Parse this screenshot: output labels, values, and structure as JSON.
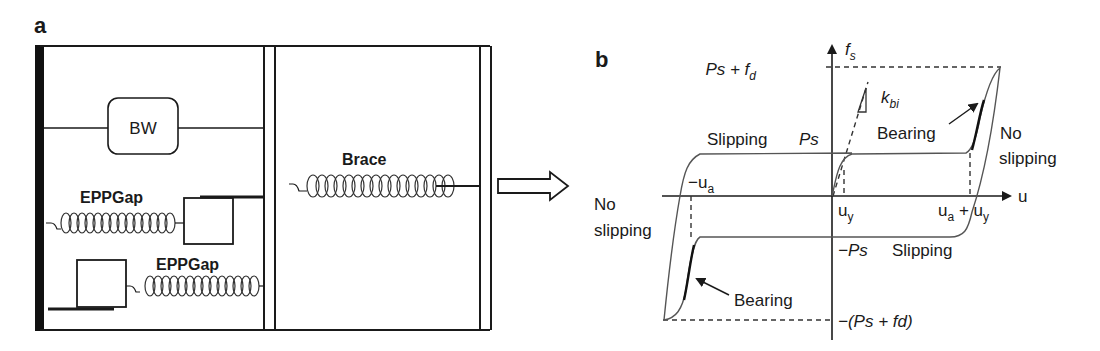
{
  "panel_a": {
    "label": "a",
    "bw_element": "BW",
    "eppgap_upper": "EPPGap",
    "eppgap_lower": "EPPGap",
    "brace": "Brace"
  },
  "panel_b": {
    "label": "b",
    "y_axis": {
      "symbol": "f",
      "subscript": "s"
    },
    "x_axis": "u",
    "ticks_y": {
      "ps_plus_fd": {
        "main": "Ps + f",
        "sub": "d"
      },
      "ps": "Ps",
      "neg_ps": "−Ps",
      "neg_ps_plus_fd": "−(Ps + fd)"
    },
    "ticks_x": {
      "uy": {
        "main": "u",
        "sub": "y"
      },
      "neg_ua": {
        "main": "−u",
        "sub": "a"
      },
      "ua_plus_uy": {
        "main1": "u",
        "sub1": "a",
        "plus": " + ",
        "main2": "u",
        "sub2": "y"
      }
    },
    "stiffness": {
      "main": "k",
      "sub": "bi"
    },
    "annotations": {
      "slipping_top": "Slipping",
      "slipping_bottom": "Slipping",
      "bearing_top": "Bearing",
      "bearing_bottom": "Bearing",
      "no_slipping_right_1": "No",
      "no_slipping_right_2": "slipping",
      "no_slipping_left_1": "No",
      "no_slipping_left_2": "slipping"
    }
  },
  "colors": {
    "ink": "#1a1a1a",
    "curve": "#555555",
    "background": "#ffffff"
  }
}
